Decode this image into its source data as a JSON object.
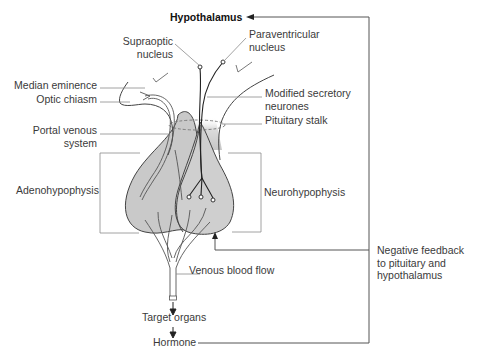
{
  "figure": {
    "colors": {
      "gland_fill": "#c8c8c8",
      "outline": "#444444",
      "leader_line": "#8a8a8a",
      "feedback_line": "#555555",
      "background": "#ffffff"
    }
  },
  "labels": {
    "hypothalamus": "Hypothalamus",
    "supraoptic_line1": "Supraoptic",
    "supraoptic_line2": "nucleus",
    "paraventricular_line1": "Paraventricular",
    "paraventricular_line2": "nucleus",
    "median_eminence": "Median eminence",
    "optic_chiasm": "Optic chiasm",
    "modified_secretory_line1": "Modified secretory",
    "modified_secretory_line2": "neurones",
    "pituitary_stalk": "Pituitary stalk",
    "portal_venous_line1": "Portal venous",
    "portal_venous_line2": "system",
    "adenohypophysis": "Adenohypophysis",
    "neurohypophysis": "Neurohypophysis",
    "venous_blood_flow": "Venous blood flow",
    "target_organs": "Target organs",
    "hormone": "Hormone",
    "negative_feedback_line1": "Negative feedback",
    "negative_feedback_line2": "to pituitary and",
    "negative_feedback_line3": "hypothalamus"
  }
}
